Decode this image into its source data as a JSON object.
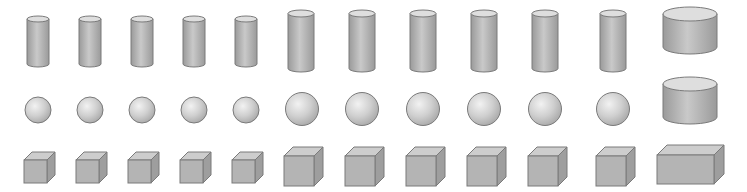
{
  "canvas": {
    "width": 747,
    "height": 192,
    "background": "#ffffff"
  },
  "colors": {
    "outline": "#7a7a7a",
    "body_edge": "#9a9a9a",
    "body_mid": "#c9c9c9",
    "cap_fill": "#dedede",
    "sphere_light": "#f2f2f2",
    "sphere_mid": "#cfcfcf",
    "sphere_dark": "#a8a8a8",
    "cube_front": "#b4b4b4",
    "cube_top": "#cdcdcd",
    "cube_side": "#9e9e9e"
  },
  "rows": {
    "cylinders": [
      {
        "x": 27,
        "y": 16,
        "w": 22,
        "h": 51,
        "cap": 6
      },
      {
        "x": 79,
        "y": 16,
        "w": 22,
        "h": 51,
        "cap": 6
      },
      {
        "x": 131,
        "y": 16,
        "w": 22,
        "h": 51,
        "cap": 6
      },
      {
        "x": 183,
        "y": 16,
        "w": 22,
        "h": 51,
        "cap": 6
      },
      {
        "x": 235,
        "y": 16,
        "w": 22,
        "h": 51,
        "cap": 6
      },
      {
        "x": 288,
        "y": 10,
        "w": 26,
        "h": 62,
        "cap": 7
      },
      {
        "x": 349,
        "y": 10,
        "w": 26,
        "h": 62,
        "cap": 7
      },
      {
        "x": 410,
        "y": 10,
        "w": 26,
        "h": 62,
        "cap": 7
      },
      {
        "x": 471,
        "y": 10,
        "w": 26,
        "h": 62,
        "cap": 7
      },
      {
        "x": 532,
        "y": 10,
        "w": 26,
        "h": 62,
        "cap": 7
      },
      {
        "x": 600,
        "y": 10,
        "w": 26,
        "h": 62,
        "cap": 7
      },
      {
        "x": 663,
        "y": 7,
        "w": 54,
        "h": 47,
        "cap": 14
      }
    ],
    "spheres": [
      {
        "cx": 38,
        "cy": 110,
        "r": 13
      },
      {
        "cx": 90,
        "cy": 110,
        "r": 13
      },
      {
        "cx": 142,
        "cy": 110,
        "r": 13
      },
      {
        "cx": 194,
        "cy": 110,
        "r": 13
      },
      {
        "cx": 246,
        "cy": 110,
        "r": 13
      },
      {
        "cx": 302,
        "cy": 109,
        "r": 16.5
      },
      {
        "cx": 362,
        "cy": 109,
        "r": 16.5
      },
      {
        "cx": 423,
        "cy": 109,
        "r": 16.5
      },
      {
        "cx": 484,
        "cy": 109,
        "r": 16.5
      },
      {
        "cx": 545,
        "cy": 109,
        "r": 16.5
      },
      {
        "cx": 613,
        "cy": 109,
        "r": 16.5
      }
    ],
    "extra_cylinders": [
      {
        "x": 663,
        "y": 77,
        "w": 54,
        "h": 47,
        "cap": 14
      }
    ],
    "cubes": [
      {
        "x": 24,
        "y": 160,
        "w": 23,
        "h": 23,
        "d": 8
      },
      {
        "x": 76,
        "y": 160,
        "w": 23,
        "h": 23,
        "d": 8
      },
      {
        "x": 128,
        "y": 160,
        "w": 23,
        "h": 23,
        "d": 8
      },
      {
        "x": 180,
        "y": 160,
        "w": 23,
        "h": 23,
        "d": 8
      },
      {
        "x": 232,
        "y": 160,
        "w": 23,
        "h": 23,
        "d": 8
      },
      {
        "x": 284,
        "y": 156,
        "w": 30,
        "h": 30,
        "d": 9
      },
      {
        "x": 345,
        "y": 156,
        "w": 30,
        "h": 30,
        "d": 9
      },
      {
        "x": 406,
        "y": 156,
        "w": 30,
        "h": 30,
        "d": 9
      },
      {
        "x": 467,
        "y": 156,
        "w": 30,
        "h": 30,
        "d": 9
      },
      {
        "x": 528,
        "y": 156,
        "w": 30,
        "h": 30,
        "d": 9
      },
      {
        "x": 596,
        "y": 156,
        "w": 30,
        "h": 30,
        "d": 9
      },
      {
        "x": 657,
        "y": 155,
        "w": 57,
        "h": 29,
        "d": 10
      }
    ]
  }
}
